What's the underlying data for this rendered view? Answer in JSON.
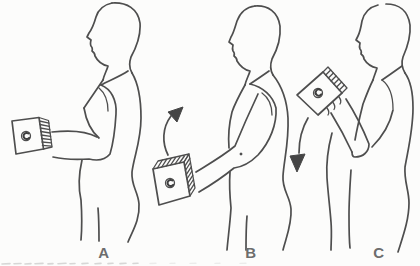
{
  "illustration": {
    "type": "line-drawing",
    "subject": "biceps-curl-exercise-sequence",
    "background": "#fcfcfb",
    "ink_color": "#4e4e4e",
    "label_color": "#6d6d6d",
    "panels": [
      {
        "label": "A",
        "description": "standing profile, forearm extended forward holding weight block"
      },
      {
        "label": "B",
        "description": "arm lowered, weight block at thigh, curved arrow pointing up"
      },
      {
        "label": "C",
        "description": "elbow flexed, weight block raised to chest, curved arrow pointing down"
      }
    ]
  }
}
